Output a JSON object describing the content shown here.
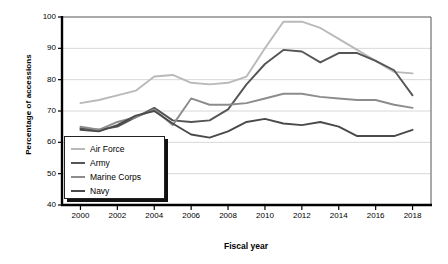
{
  "chart_data": {
    "type": "line",
    "title": "",
    "xlabel": "Fiscal year",
    "ylabel": "Percentage of accessions",
    "xlim": [
      1999,
      2019
    ],
    "ylim": [
      40,
      100
    ],
    "ytick_labels": [
      "100",
      "90",
      "80",
      "70",
      "60",
      "50",
      "40"
    ],
    "ytick_values": [
      100,
      90,
      80,
      70,
      60,
      50,
      40
    ],
    "xtick_labels": [
      "2000",
      "2002",
      "2004",
      "2006",
      "2008",
      "2010",
      "2012",
      "2014",
      "2016",
      "2018"
    ],
    "xtick_values": [
      2000,
      2002,
      2004,
      2006,
      2008,
      2010,
      2012,
      2014,
      2016,
      2018
    ],
    "grid": "horizontal",
    "legend_position": "lower-left",
    "x": [
      2000,
      2001,
      2002,
      2003,
      2004,
      2005,
      2006,
      2007,
      2008,
      2009,
      2010,
      2011,
      2012,
      2013,
      2014,
      2015,
      2016,
      2017,
      2018
    ],
    "series": [
      {
        "name": "Air Force",
        "color": "#b9b9b9",
        "values": [
          72.5,
          73.5,
          75.0,
          76.5,
          81.0,
          81.5,
          79.0,
          78.5,
          79.0,
          81.0,
          90.0,
          98.5,
          98.5,
          96.5,
          93.0,
          89.5,
          86.0,
          82.5,
          82.0
        ]
      },
      {
        "name": "Army",
        "color": "#555555",
        "values": [
          64.5,
          64.0,
          65.0,
          68.0,
          71.0,
          67.0,
          66.5,
          67.0,
          70.5,
          78.5,
          85.0,
          89.5,
          89.0,
          85.5,
          88.5,
          88.5,
          86.0,
          83.0,
          75.0
        ]
      },
      {
        "name": "Marine Corps",
        "color": "#8c8c8c",
        "values": [
          65.0,
          64.0,
          66.5,
          68.0,
          70.5,
          65.5,
          74.0,
          72.0,
          72.0,
          72.5,
          74.0,
          75.5,
          75.5,
          74.5,
          74.0,
          73.5,
          73.5,
          72.0,
          71.0
        ]
      },
      {
        "name": "Navy",
        "color": "#4a4a4a",
        "values": [
          64.0,
          63.5,
          65.5,
          68.5,
          70.0,
          66.0,
          62.5,
          61.5,
          63.5,
          66.5,
          67.5,
          66.0,
          65.5,
          66.5,
          65.0,
          62.0,
          62.0,
          62.0,
          64.0
        ]
      }
    ]
  },
  "legend": {
    "items": [
      {
        "label": "Air Force"
      },
      {
        "label": "Army"
      },
      {
        "label": "Marine Corps"
      },
      {
        "label": "Navy"
      }
    ]
  }
}
